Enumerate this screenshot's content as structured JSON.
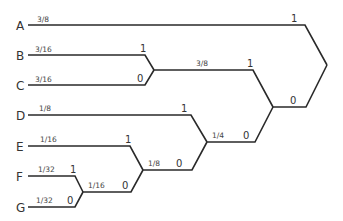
{
  "diagram": {
    "type": "huffman-tree",
    "leaves": [
      {
        "symbol": "A",
        "probability": "3/8"
      },
      {
        "symbol": "B",
        "probability": "3/16"
      },
      {
        "symbol": "C",
        "probability": "3/16"
      },
      {
        "symbol": "D",
        "probability": "1/8"
      },
      {
        "symbol": "E",
        "probability": "1/16"
      },
      {
        "symbol": "F",
        "probability": "1/32"
      },
      {
        "symbol": "G",
        "probability": "1/32"
      }
    ],
    "internal_nodes": [
      {
        "id": "FG",
        "probability": "1/16",
        "upper_bit": "1",
        "lower_bit": "0"
      },
      {
        "id": "EFG",
        "probability": "1/8",
        "upper_bit": "1",
        "lower_bit": "0"
      },
      {
        "id": "DEFG",
        "probability": "1/4",
        "upper_bit": "1",
        "lower_bit": "0"
      },
      {
        "id": "BC",
        "probability": "3/8",
        "upper_bit": "1",
        "lower_bit": "0"
      },
      {
        "id": "BCDEFG",
        "upper_bit": "1",
        "lower_bit": "0"
      },
      {
        "id": "root",
        "upper_bit": "1",
        "lower_bit": "0"
      }
    ]
  }
}
